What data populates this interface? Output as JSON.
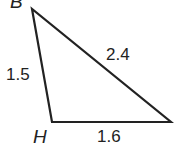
{
  "diagram": {
    "type": "triangle",
    "vertices": [
      {
        "label": "B",
        "x": 32,
        "y": 9
      },
      {
        "label": "H",
        "x": 52,
        "y": 122
      },
      {
        "label": "",
        "x": 171,
        "y": 122
      }
    ],
    "sides": [
      {
        "between": "B-H",
        "length": "1.5"
      },
      {
        "between": "H-right",
        "length": "1.6"
      },
      {
        "between": "B-right",
        "length": "2.4"
      }
    ],
    "stroke_color": "#222222"
  }
}
